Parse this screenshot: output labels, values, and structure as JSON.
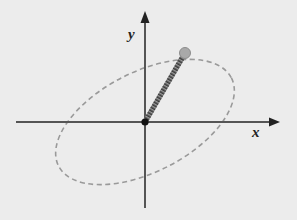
{
  "diagram": {
    "type": "2D orbit / spring oscillator in xy-plane",
    "background_color": "#ececec",
    "axes": {
      "x_label": "x",
      "y_label": "y",
      "color": "#555555"
    },
    "origin": {
      "color": "#111111"
    },
    "ellipse": {
      "style": "dashed",
      "color": "#9a9a9a",
      "rotation_deg": -27
    },
    "spring": {
      "color": "#444444",
      "style": "coiled"
    },
    "mass": {
      "color": "#a8a8a8",
      "stroke": "#8a8a8a"
    }
  }
}
